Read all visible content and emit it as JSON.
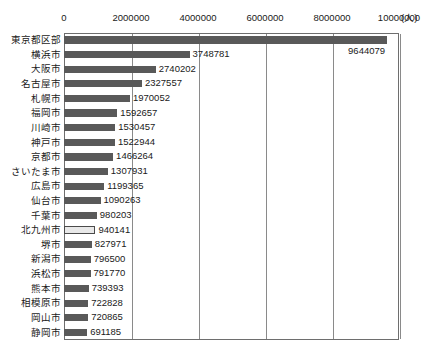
{
  "chart_data": {
    "type": "bar",
    "orientation": "horizontal",
    "title": "",
    "xlabel": "(人)",
    "ylabel": "",
    "xlim": [
      0,
      10000000
    ],
    "xticks": [
      0,
      2000000,
      4000000,
      6000000,
      8000000,
      10000000
    ],
    "xtick_labels": [
      "0",
      "2000000",
      "4000000",
      "6000000",
      "8000000",
      "10000000"
    ],
    "unit_label": "(人)",
    "grid": true,
    "legend": "none",
    "categories": [
      "東京都区部",
      "横浜市",
      "大阪市",
      "名古屋市",
      "札幌市",
      "福岡市",
      "川崎市",
      "神戸市",
      "京都市",
      "さいたま市",
      "広島市",
      "仙台市",
      "千葉市",
      "北九州市",
      "堺市",
      "新潟市",
      "浜松市",
      "熊本市",
      "相模原市",
      "岡山市",
      "静岡市"
    ],
    "values": [
      9644079,
      3748781,
      2740202,
      2327557,
      1970052,
      1592657,
      1530457,
      1522944,
      1466264,
      1307931,
      1199365,
      1090263,
      980203,
      940141,
      827971,
      796500,
      791770,
      739393,
      722828,
      720865,
      691185
    ],
    "value_labels": [
      "9644079",
      "3748781",
      "2740202",
      "2327557",
      "1970052",
      "1592657",
      "1530457",
      "1522944",
      "1466264",
      "1307931",
      "1199365",
      "1090263",
      "980203",
      "940141",
      "827971",
      "796500",
      "791770",
      "739393",
      "722828",
      "720865",
      "691185"
    ],
    "highlighted_index": 13,
    "colors": {
      "bar": "#595959",
      "highlight_fill": "#e8e8e8",
      "highlight_border": "#4a4a4a",
      "gridline": "#8a8a8a",
      "frame": "#6e6e6e",
      "text": "#1a1a1a"
    }
  }
}
